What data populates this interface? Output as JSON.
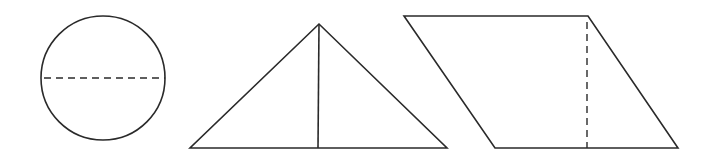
{
  "diagram": {
    "stroke_color": "#2a2a2a",
    "background": "#ffffff",
    "shapes": [
      {
        "type": "circle",
        "name": "circle",
        "auxiliary": "dashed horizontal diameter"
      },
      {
        "type": "triangle",
        "name": "triangle",
        "auxiliary": "solid vertical height from apex to base"
      },
      {
        "type": "parallelogram",
        "name": "parallelogram",
        "auxiliary": "dashed vertical height"
      }
    ]
  }
}
